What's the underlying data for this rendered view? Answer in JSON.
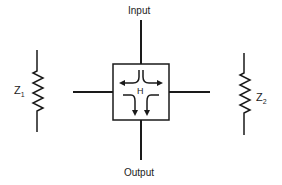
{
  "diagram": {
    "labels": {
      "input": "Input",
      "output": "Output",
      "box": "H",
      "z1_main": "Z",
      "z1_sub": "1",
      "z2_main": "Z",
      "z2_sub": "2"
    },
    "nodes": [
      {
        "id": "H",
        "label": "H",
        "shape": "square",
        "content": "four curved flow arrows"
      },
      {
        "id": "Z1",
        "label": "Z1",
        "shape": "resistor (zigzag)",
        "position": "left"
      },
      {
        "id": "Z2",
        "label": "Z2",
        "shape": "resistor (zigzag)",
        "position": "right"
      }
    ],
    "edges": [
      {
        "from": "Input",
        "to": "H",
        "direction": "vertical-top"
      },
      {
        "from": "H",
        "to": "Output",
        "direction": "vertical-bottom"
      },
      {
        "from": "H",
        "to": "left-line",
        "direction": "horizontal-left"
      },
      {
        "from": "H",
        "to": "right-line",
        "direction": "horizontal-right"
      }
    ],
    "colors": {
      "stroke": "#1a1a1a",
      "background": "#ffffff",
      "text": "#222222"
    }
  }
}
